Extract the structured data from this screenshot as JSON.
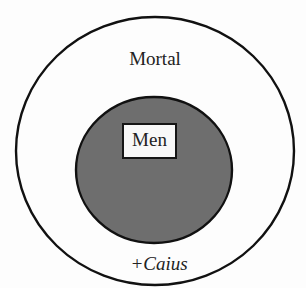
{
  "diagram": {
    "type": "euler-diagram",
    "outer_set": {
      "label": "Mortal",
      "fill": "#fdfdfd",
      "stroke": "#111111"
    },
    "inner_set": {
      "label": "Men",
      "fill": "#6e6e6e",
      "stroke": "#111111"
    },
    "element": {
      "label": "+Caius",
      "location": "inside Mortal, outside Men"
    }
  }
}
